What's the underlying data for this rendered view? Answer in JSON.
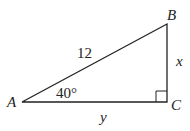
{
  "diagram": {
    "type": "right-triangle",
    "vertices": {
      "A": {
        "label": "A"
      },
      "B": {
        "label": "B"
      },
      "C": {
        "label": "C"
      }
    },
    "sides": {
      "hypotenuse_AB": "12",
      "opposite_BC": "x",
      "adjacent_AC": "y"
    },
    "angle_A": "40°",
    "right_angle_at": "C",
    "colors": {
      "stroke": "#222222",
      "background": "#ffffff"
    }
  }
}
